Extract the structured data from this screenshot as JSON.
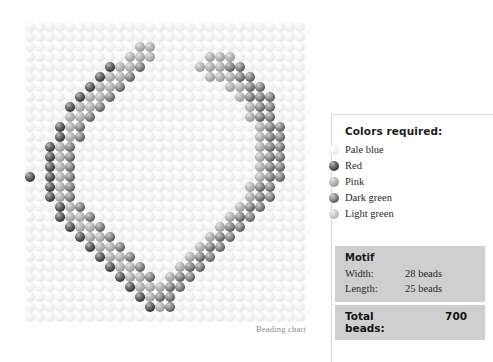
{
  "chart": {
    "caption": "Beading chart",
    "grid": {
      "cols": 28,
      "rows": 30,
      "bead_px": 10
    },
    "colors": {
      "pale_blue": "#e6e8ea",
      "red": "#3b3b3b",
      "pink": "#9a9a9a",
      "dark_green": "#5d5d5d",
      "light_green": "#b4b6b6"
    },
    "pattern_legend_keys": [
      "pale-blue",
      "red",
      "pink",
      "dark-green",
      "light-green"
    ],
    "pattern": [
      "0000000000000000000000000000",
      "0000000000000000000000000000",
      "0000000000022000000000000000",
      "0000000000222000002220000000",
      "0000000012230000022233000000",
      "0000000122300000002223300000",
      "0000001223000000000022330000",
      "0000012230000000000002333000",
      "0000122300000000000000233000",
      "0000223000000000000000233000",
      "0001230000000000000000023300",
      "0001230000000000000000023300",
      "0012300000000000000000023300",
      "0012300000000000000000023300",
      "0012300000000000000000023300",
      "1012300000000000000000023300",
      "0012300000000000000000233000",
      "0012300000000000000000233000",
      "0001230000000000000002330000",
      "0001223000000000000023300000",
      "0000122300000000000233000000",
      "0000012230000000002330000000",
      "0000001223000000023300000000",
      "0000000122300000233000000000",
      "0000000012230002330000000000",
      "0000000001223023300000000000",
      "0000000000122233000000000000",
      "0000000000012330000000000000",
      "0000000000001230000000000000",
      "0000000000000000000000000000"
    ]
  },
  "legend": {
    "title": "Colors required:",
    "items": [
      {
        "label": "Pale blue",
        "swatch": "pale-blue"
      },
      {
        "label": "Red",
        "swatch": "red"
      },
      {
        "label": "Pink",
        "swatch": "pink"
      },
      {
        "label": "Dark green",
        "swatch": "dark-green"
      },
      {
        "label": "Light green",
        "swatch": "light-green"
      }
    ]
  },
  "motif": {
    "heading": "Motif",
    "width_label": "Width:",
    "width_value": "28 beads",
    "length_label": "Length:",
    "length_value": "25 beads",
    "total_label": "Total beads:",
    "total_value": "700"
  }
}
